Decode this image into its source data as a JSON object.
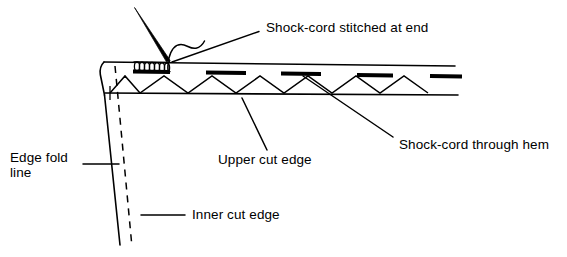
{
  "figure": {
    "type": "line-diagram",
    "background_color": "#ffffff",
    "ink_color": "#000000",
    "width": 567,
    "height": 257
  },
  "labels": {
    "shock_cord_stitched": "Shock-cord stitched at end",
    "shock_cord_through_hem": "Shock-cord through hem",
    "upper_cut_edge": "Upper cut edge",
    "edge_fold_line": "Edge fold\nline",
    "inner_cut_edge": "Inner cut edge"
  },
  "parts": {
    "top_edge": "top-fabric-edge-line",
    "hem_stitch_line": "hem-lower-stitch-line",
    "zigzag": "zigzag-basting-stitch",
    "stitch_bars": "dashed-stitch-bars",
    "coil": "shock-cord-coil",
    "needle": "needle-pointer",
    "thread": "thread-curve",
    "fold_edge": "edge-fold-solid-line",
    "inner_edge": "inner-cut-dashed-line"
  },
  "geometry": {
    "stitch_bar_count": 5,
    "zigzag_peak_count": 9,
    "coil_turns": 7,
    "top_edge_y": 62,
    "hem_line_y": 93,
    "right_extent_x": 458,
    "corner_x": 104,
    "bottom_y": 245
  }
}
